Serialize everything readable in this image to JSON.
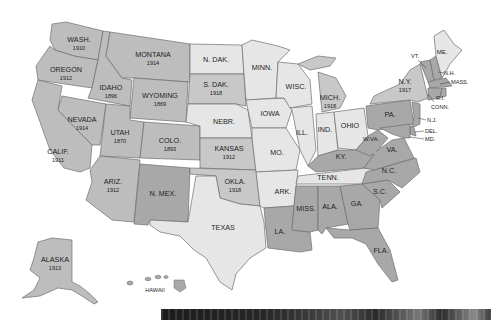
{
  "map": {
    "title": "",
    "legend_colors": {
      "full_suffrage_west": "#bdbdbd",
      "no_state_suffrage_light": "#e6e6e6",
      "mid_gray": "#c8c8c8",
      "dark_south_east": "#a8a8a8",
      "border": "#6e6e6e"
    },
    "states": [
      {
        "abbr": "WASH.",
        "year": "1910"
      },
      {
        "abbr": "OREGON",
        "year": "1912"
      },
      {
        "abbr": "CALIF.",
        "year": "1911"
      },
      {
        "abbr": "IDAHO",
        "year": "1896"
      },
      {
        "abbr": "NEVADA",
        "year": "1914"
      },
      {
        "abbr": "MONTANA",
        "year": "1914"
      },
      {
        "abbr": "WYOMING",
        "year": "1869"
      },
      {
        "abbr": "UTAH",
        "year": "1870"
      },
      {
        "abbr": "COLO.",
        "year": "1893"
      },
      {
        "abbr": "ARIZ.",
        "year": "1912"
      },
      {
        "abbr": "N. MEX.",
        "year": ""
      },
      {
        "abbr": "N. DAK.",
        "year": ""
      },
      {
        "abbr": "S. DAK.",
        "year": "1918"
      },
      {
        "abbr": "NEBR.",
        "year": ""
      },
      {
        "abbr": "KANSAS",
        "year": "1912"
      },
      {
        "abbr": "OKLA.",
        "year": "1918"
      },
      {
        "abbr": "TEXAS",
        "year": ""
      },
      {
        "abbr": "MINN.",
        "year": ""
      },
      {
        "abbr": "IOWA",
        "year": ""
      },
      {
        "abbr": "MO.",
        "year": ""
      },
      {
        "abbr": "ARK.",
        "year": ""
      },
      {
        "abbr": "LA.",
        "year": ""
      },
      {
        "abbr": "WISC.",
        "year": ""
      },
      {
        "abbr": "ILL.",
        "year": ""
      },
      {
        "abbr": "MICH.",
        "year": "1918"
      },
      {
        "abbr": "IND.",
        "year": ""
      },
      {
        "abbr": "OHIO",
        "year": ""
      },
      {
        "abbr": "KY.",
        "year": ""
      },
      {
        "abbr": "TENN.",
        "year": ""
      },
      {
        "abbr": "MISS.",
        "year": ""
      },
      {
        "abbr": "ALA.",
        "year": ""
      },
      {
        "abbr": "GA.",
        "year": ""
      },
      {
        "abbr": "FLA.",
        "year": ""
      },
      {
        "abbr": "S.C.",
        "year": ""
      },
      {
        "abbr": "N.C.",
        "year": ""
      },
      {
        "abbr": "VA.",
        "year": ""
      },
      {
        "abbr": "W.VA.",
        "year": ""
      },
      {
        "abbr": "PA.",
        "year": ""
      },
      {
        "abbr": "N.Y.",
        "year": "1917"
      },
      {
        "abbr": "VT.",
        "year": ""
      },
      {
        "abbr": "N.H.",
        "year": ""
      },
      {
        "abbr": "ME.",
        "year": ""
      },
      {
        "abbr": "MASS.",
        "year": ""
      },
      {
        "abbr": "R.I.",
        "year": ""
      },
      {
        "abbr": "CONN.",
        "year": ""
      },
      {
        "abbr": "N.J.",
        "year": ""
      },
      {
        "abbr": "DEL.",
        "year": ""
      },
      {
        "abbr": "MD.",
        "year": ""
      },
      {
        "abbr": "ALASKA",
        "year": "1913"
      },
      {
        "abbr": "HAWAII",
        "year": ""
      }
    ]
  },
  "photo_strip": {
    "description": "black-and-white photograph (partially visible)"
  }
}
